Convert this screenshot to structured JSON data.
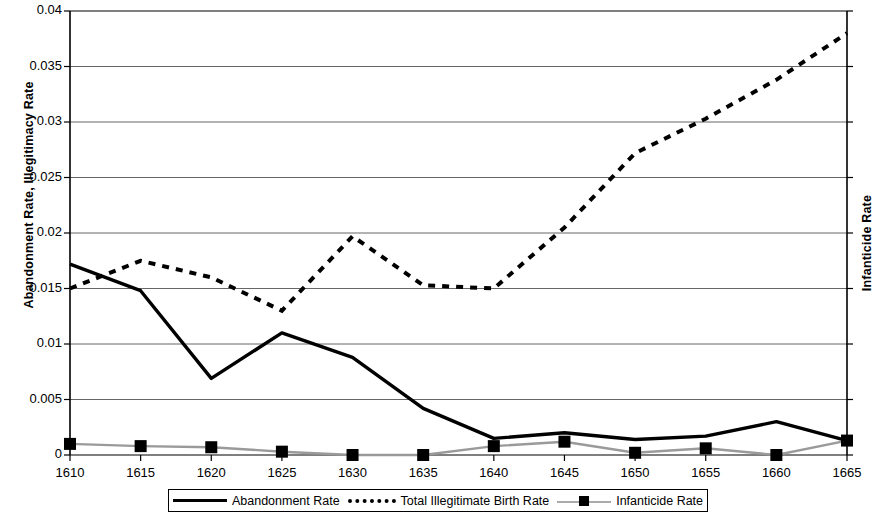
{
  "chart_data": {
    "type": "line",
    "title": "",
    "xlabel": "",
    "ylabel": "Abandonment Rate, Illegitimacy Rate",
    "y2label": "Infanticide Rate",
    "x": [
      1610,
      1615,
      1620,
      1625,
      1630,
      1635,
      1640,
      1645,
      1650,
      1655,
      1660,
      1665
    ],
    "xtick_labels": [
      "1610",
      "1615",
      "1620",
      "1625",
      "1630",
      "1635",
      "1640",
      "1645",
      "1650",
      "1655",
      "1660",
      "1665"
    ],
    "ytick_labels": [
      "0",
      "0.005",
      "0.01",
      "0.015",
      "0.02",
      "0.025",
      "0.03",
      "0.035",
      "0.04"
    ],
    "ytick_values": [
      0,
      0.005,
      0.01,
      0.015,
      0.02,
      0.025,
      0.03,
      0.035,
      0.04
    ],
    "ylim": [
      0,
      0.04
    ],
    "xlim": [
      1610,
      1665
    ],
    "grid": true,
    "legend_position": "bottom",
    "series": [
      {
        "name": "Abandonment Rate",
        "style": "solid",
        "color": "#000000",
        "values": [
          0.0172,
          0.0148,
          0.0069,
          0.011,
          0.0088,
          0.0042,
          0.0015,
          0.002,
          0.0014,
          0.0017,
          0.003,
          0.0013
        ]
      },
      {
        "name": "Total Illegitimate Birth Rate",
        "style": "dotted",
        "color": "#000000",
        "values": [
          0.015,
          0.0175,
          0.016,
          0.013,
          0.0197,
          0.0153,
          0.015,
          0.0205,
          0.0272,
          0.0303,
          0.0338,
          0.038
        ]
      },
      {
        "name": "Infanticide Rate",
        "style": "marker-line",
        "color": "#9a9a9a",
        "marker": "square",
        "marker_color": "#000000",
        "values": [
          0.001,
          0.0008,
          0.0007,
          0.0003,
          0.0,
          0.0,
          0.0008,
          0.0012,
          0.0002,
          0.0006,
          0.0,
          0.0013
        ]
      }
    ]
  },
  "legend": {
    "items": [
      {
        "label": "Abandonment Rate",
        "icon": "solid-line-swatch"
      },
      {
        "label": "Total Illegitimate Birth Rate",
        "icon": "dotted-line-swatch"
      },
      {
        "label": "Infanticide Rate",
        "icon": "square-marker-line-swatch"
      }
    ]
  }
}
